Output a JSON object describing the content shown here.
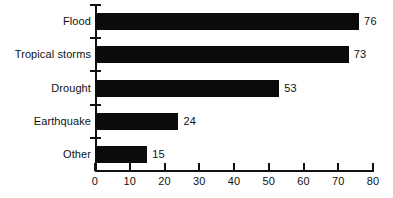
{
  "chart_data": {
    "type": "bar",
    "orientation": "horizontal",
    "title": "",
    "subtitle": "",
    "xlabel": "",
    "ylabel": "",
    "categories": [
      "Flood",
      "Tropical storms",
      "Drought",
      "Earthquake",
      "Other"
    ],
    "values": [
      76,
      73,
      53,
      24,
      15
    ],
    "value_labels": [
      "76",
      "73",
      "53",
      "24",
      "15"
    ],
    "xlim": [
      0,
      80
    ],
    "xticks": [
      0,
      10,
      20,
      30,
      40,
      50,
      60,
      70,
      80
    ],
    "xtick_labels": [
      "0",
      "10",
      "20",
      "30",
      "40",
      "50",
      "60",
      "70",
      "80"
    ],
    "grid": false,
    "legend": false,
    "bar_color": "#0b0b0b",
    "axis_color": "#111111",
    "background_color": "#ffffff"
  }
}
